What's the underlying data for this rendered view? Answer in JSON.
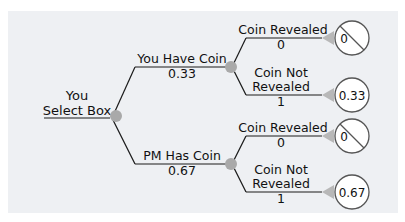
{
  "tree": {
    "root": {
      "label_line1": "You",
      "label_line2": "Select Box"
    },
    "branches": [
      {
        "label": "You Have Coin",
        "probability": "0.33",
        "outcomes": [
          {
            "label_line1": "Coin Revealed",
            "label_line2": "",
            "probability": "0",
            "payoff": "0",
            "excluded": true
          },
          {
            "label_line1": "Coin Not",
            "label_line2": "Revealed",
            "probability": "1",
            "payoff": "0.33",
            "excluded": false
          }
        ]
      },
      {
        "label": "PM Has Coin",
        "probability": "0.67",
        "outcomes": [
          {
            "label_line1": "Coin Revealed",
            "label_line2": "",
            "probability": "0",
            "payoff": "0",
            "excluded": true
          },
          {
            "label_line1": "Coin Not",
            "label_line2": "Revealed",
            "probability": "1",
            "payoff": "0.67",
            "excluded": false
          }
        ]
      }
    ]
  },
  "colors": {
    "panel": "#eef0f3",
    "line": "#1a1a1a",
    "node": "#a9a9a9",
    "triangle": "#b8b8b8",
    "circle_stroke": "#555555"
  }
}
